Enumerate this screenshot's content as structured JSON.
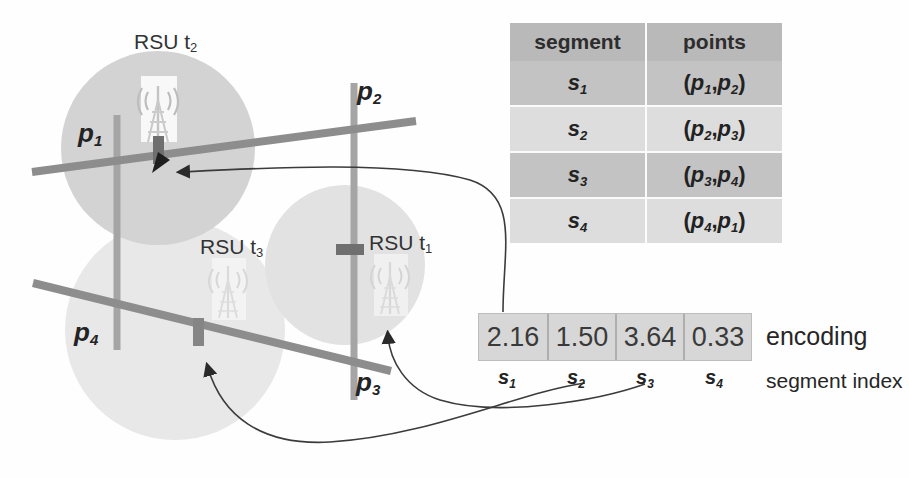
{
  "figure": {
    "type": "road-network-segment-encoding-diagram",
    "background": "#fefefe"
  },
  "map": {
    "point_labels": [
      {
        "name": "p1",
        "text": "p",
        "sub": "1",
        "x": 78,
        "y": 118
      },
      {
        "name": "p2",
        "text": "p",
        "sub": "2",
        "x": 357,
        "y": 76
      },
      {
        "name": "p3",
        "text": "p",
        "sub": "3",
        "x": 356,
        "y": 367
      },
      {
        "name": "p4",
        "text": "p",
        "sub": "4",
        "x": 74,
        "y": 317
      }
    ],
    "rsu_labels": [
      {
        "name": "rsu-t2",
        "text": "RSU t",
        "sub": "2",
        "x": 134,
        "y": 30
      },
      {
        "name": "rsu-t3",
        "text": "RSU t",
        "sub": "3",
        "x": 200,
        "y": 235
      },
      {
        "name": "rsu-t1",
        "text": "RSU t",
        "sub": "1",
        "x": 369,
        "y": 231
      }
    ],
    "coverage_circles": [
      {
        "name": "coverage-circle-t2",
        "cx": 158,
        "cy": 148,
        "r": 97,
        "fill": "#d2d2d2"
      },
      {
        "name": "coverage-circle-t3",
        "cx": 175,
        "cy": 330,
        "r": 110,
        "fill": "#e6e6e6"
      },
      {
        "name": "coverage-circle-t1",
        "cx": 345,
        "cy": 265,
        "r": 80,
        "fill": "#e0e0e0"
      }
    ],
    "roads": [
      {
        "name": "road-horizontal-top",
        "x1": 32,
        "y1": 172,
        "x2": 416,
        "y2": 121,
        "color": "#8c8c8c",
        "width": 8
      },
      {
        "name": "road-horizontal-bottom",
        "x1": 33,
        "y1": 283,
        "x2": 391,
        "y2": 371,
        "color": "#8c8c8c",
        "width": 8
      },
      {
        "name": "road-vertical-left",
        "x1": 117,
        "y1": 115,
        "x2": 117,
        "y2": 350,
        "color": "#a2a2a2",
        "width": 7
      },
      {
        "name": "road-vertical-right",
        "x1": 354,
        "y1": 83,
        "x2": 354,
        "y2": 400,
        "color": "#a2a2a2",
        "width": 7
      }
    ],
    "rsu_markers": [
      {
        "name": "rsu-marker-t2",
        "x": 158,
        "y": 148,
        "orientation": "vertical"
      },
      {
        "name": "rsu-marker-t3",
        "x": 198,
        "y": 330,
        "orientation": "vertical"
      },
      {
        "name": "rsu-marker-t1",
        "x": 348,
        "y": 249,
        "orientation": "horizontal"
      }
    ],
    "towers": [
      {
        "name": "tower-icon-t2",
        "x": 158,
        "y": 107
      },
      {
        "name": "tower-icon-t3",
        "x": 228,
        "y": 292
      },
      {
        "name": "tower-icon-t1",
        "x": 390,
        "y": 288
      }
    ]
  },
  "segment_table": {
    "name": "segment-points-table",
    "headers": [
      "segment",
      "points"
    ],
    "rows": [
      {
        "segment": "s",
        "segment_sub": "1",
        "points": "(p,p)",
        "p_first": "p",
        "p_first_sub": "1",
        "p_second": "p",
        "p_second_sub": "2"
      },
      {
        "segment": "s",
        "segment_sub": "2",
        "points": "(p,p)",
        "p_first": "p",
        "p_first_sub": "2",
        "p_second": "p",
        "p_second_sub": "3"
      },
      {
        "segment": "s",
        "segment_sub": "3",
        "points": "(p,p)",
        "p_first": "p",
        "p_first_sub": "3",
        "p_second": "p",
        "p_second_sub": "4"
      },
      {
        "segment": "s",
        "segment_sub": "4",
        "points": "(p,p)",
        "p_first": "p",
        "p_first_sub": "4",
        "p_second": "p",
        "p_second_sub": "1"
      }
    ]
  },
  "encoding": {
    "name": "encoding-vector",
    "caption": "encoding",
    "index_caption": "segment index",
    "cells": [
      {
        "value": "2.16",
        "index": "s",
        "index_sub": "1"
      },
      {
        "value": "1.50",
        "index": "s",
        "index_sub": "2"
      },
      {
        "value": "3.64",
        "index": "s",
        "index_sub": "3"
      },
      {
        "value": "0.33",
        "index": "s",
        "index_sub": "4"
      }
    ]
  },
  "connectors": [
    {
      "name": "connector-s1-to-rsu-t2",
      "from": "encoding-cell-1",
      "to": "rsu-marker-t2",
      "arrow_at": "map"
    },
    {
      "name": "connector-s2-to-rsu-t3",
      "from": "encoding-cell-2",
      "to": "rsu-marker-t3",
      "arrow_at": "map"
    },
    {
      "name": "connector-s3-to-rsu-t1",
      "from": "encoding-cell-3",
      "to": "rsu-marker-t1",
      "arrow_at": "map"
    }
  ],
  "colors": {
    "road_dark": "#8c8c8c",
    "road_light": "#a2a2a2",
    "marker": "#6f6f6f",
    "table_header_bg": "#b9b9b9",
    "table_row_dark": "#c3c3c3",
    "table_row_light": "#dddddd",
    "encoding_bg": "#d7d7d7",
    "connector": "#3b3b3b"
  }
}
